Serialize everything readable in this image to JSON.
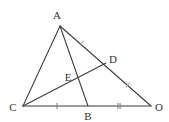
{
  "figure": {
    "canvas": {
      "width": 169,
      "height": 122
    },
    "background_color": "#ffffff",
    "line_color": "#3a3a42",
    "tick_color": "#7d7d86",
    "label_color": "#33333b",
    "points": {
      "A": {
        "label": "A",
        "x": 60,
        "y": 26,
        "label_x": 57,
        "label_y": 15
      },
      "C": {
        "label": "C",
        "x": 23,
        "y": 106,
        "label_x": 13,
        "label_y": 107
      },
      "O": {
        "label": "O",
        "x": 151,
        "y": 106,
        "label_x": 159,
        "label_y": 107
      },
      "B": {
        "label": "B",
        "x": 88,
        "y": 106,
        "label_x": 88,
        "label_y": 116
      },
      "D": {
        "label": "D",
        "x": 106,
        "y": 63,
        "label_x": 113,
        "label_y": 59
      },
      "E": {
        "label": "E",
        "x": 78,
        "y": 80,
        "label_x": 68,
        "label_y": 77
      }
    },
    "segments": [
      {
        "name": "segment-CA",
        "from": "C",
        "to": "A"
      },
      {
        "name": "segment-CO",
        "from": "C",
        "to": "O"
      },
      {
        "name": "segment-AO",
        "from": "A",
        "to": "O"
      },
      {
        "name": "segment-AB",
        "from": "A",
        "to": "B"
      },
      {
        "name": "segment-CD",
        "from": "C",
        "to": "D"
      }
    ],
    "tick_marks": [
      {
        "name": "tick-CB",
        "segment": "CB",
        "count": 1,
        "x": 57,
        "y": 106,
        "angle": 0,
        "style": "solid"
      },
      {
        "name": "tick-BO",
        "segment": "BO",
        "count": 2,
        "x": 119,
        "y": 106,
        "angle": 0,
        "style": "solid"
      },
      {
        "name": "tick-AD",
        "segment": "AD",
        "count": 1,
        "x": 82,
        "y": 43,
        "angle": 37,
        "style": "faint"
      },
      {
        "name": "tick-DO",
        "segment": "DO",
        "count": 1,
        "x": 128,
        "y": 85,
        "angle": 40,
        "style": "faint"
      }
    ]
  }
}
